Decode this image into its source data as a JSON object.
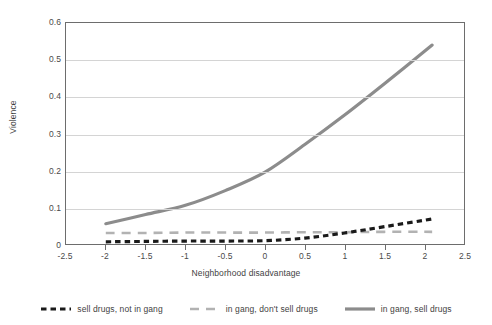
{
  "chart_data": {
    "type": "line",
    "title": "",
    "xlabel": "Neighborhood disadvantage",
    "ylabel": "Violence",
    "xlim": [
      -2.5,
      2.5
    ],
    "ylim": [
      0,
      0.6
    ],
    "xticks": [
      "-2.5",
      "-2",
      "-1.5",
      "-1",
      "-0.5",
      "0",
      "0.5",
      "1",
      "1.5",
      "2",
      "2.5"
    ],
    "xtick_values": [
      -2.5,
      -2,
      -1.5,
      -1,
      -0.5,
      0,
      0.5,
      1,
      1.5,
      2,
      2.5
    ],
    "yticks": [
      "0",
      "0.1",
      "0.2",
      "0.3",
      "0.4",
      "0.5",
      "0.6"
    ],
    "ytick_values": [
      0,
      0.1,
      0.2,
      0.3,
      0.4,
      0.5,
      0.6
    ],
    "grid": "horizontal",
    "legend_position": "bottom",
    "x": [
      -2.0,
      -1.5,
      -1.0,
      -0.5,
      0.0,
      0.5,
      1.0,
      1.5,
      2.1
    ],
    "series": [
      {
        "name": "sell drugs, not in gang",
        "color": "#1a1a1a",
        "style": "dotted",
        "width": 3.2,
        "values": [
          0.006,
          0.007,
          0.008,
          0.008,
          0.009,
          0.016,
          0.03,
          0.047,
          0.068
        ]
      },
      {
        "name": "in gang, don't sell drugs",
        "color": "#b2b2b2",
        "style": "dashed",
        "width": 2.6,
        "values": [
          0.03,
          0.03,
          0.031,
          0.031,
          0.031,
          0.032,
          0.032,
          0.033,
          0.033
        ]
      },
      {
        "name": "in gang, sell drugs",
        "color": "#8c8c8c",
        "style": "solid",
        "width": 3.2,
        "values": [
          0.055,
          0.08,
          0.105,
          0.145,
          0.195,
          0.27,
          0.35,
          0.435,
          0.54
        ]
      }
    ]
  },
  "axes": {
    "y_title": "Violence",
    "x_title": "Neighborhood disadvantage"
  },
  "legend": {
    "items": [
      {
        "label": "sell drugs, not in gang",
        "color": "#1a1a1a",
        "style": "dotted"
      },
      {
        "label": "in gang, don't sell drugs",
        "color": "#b2b2b2",
        "style": "dashed"
      },
      {
        "label": "in gang, sell drugs",
        "color": "#8c8c8c",
        "style": "solid"
      }
    ]
  }
}
